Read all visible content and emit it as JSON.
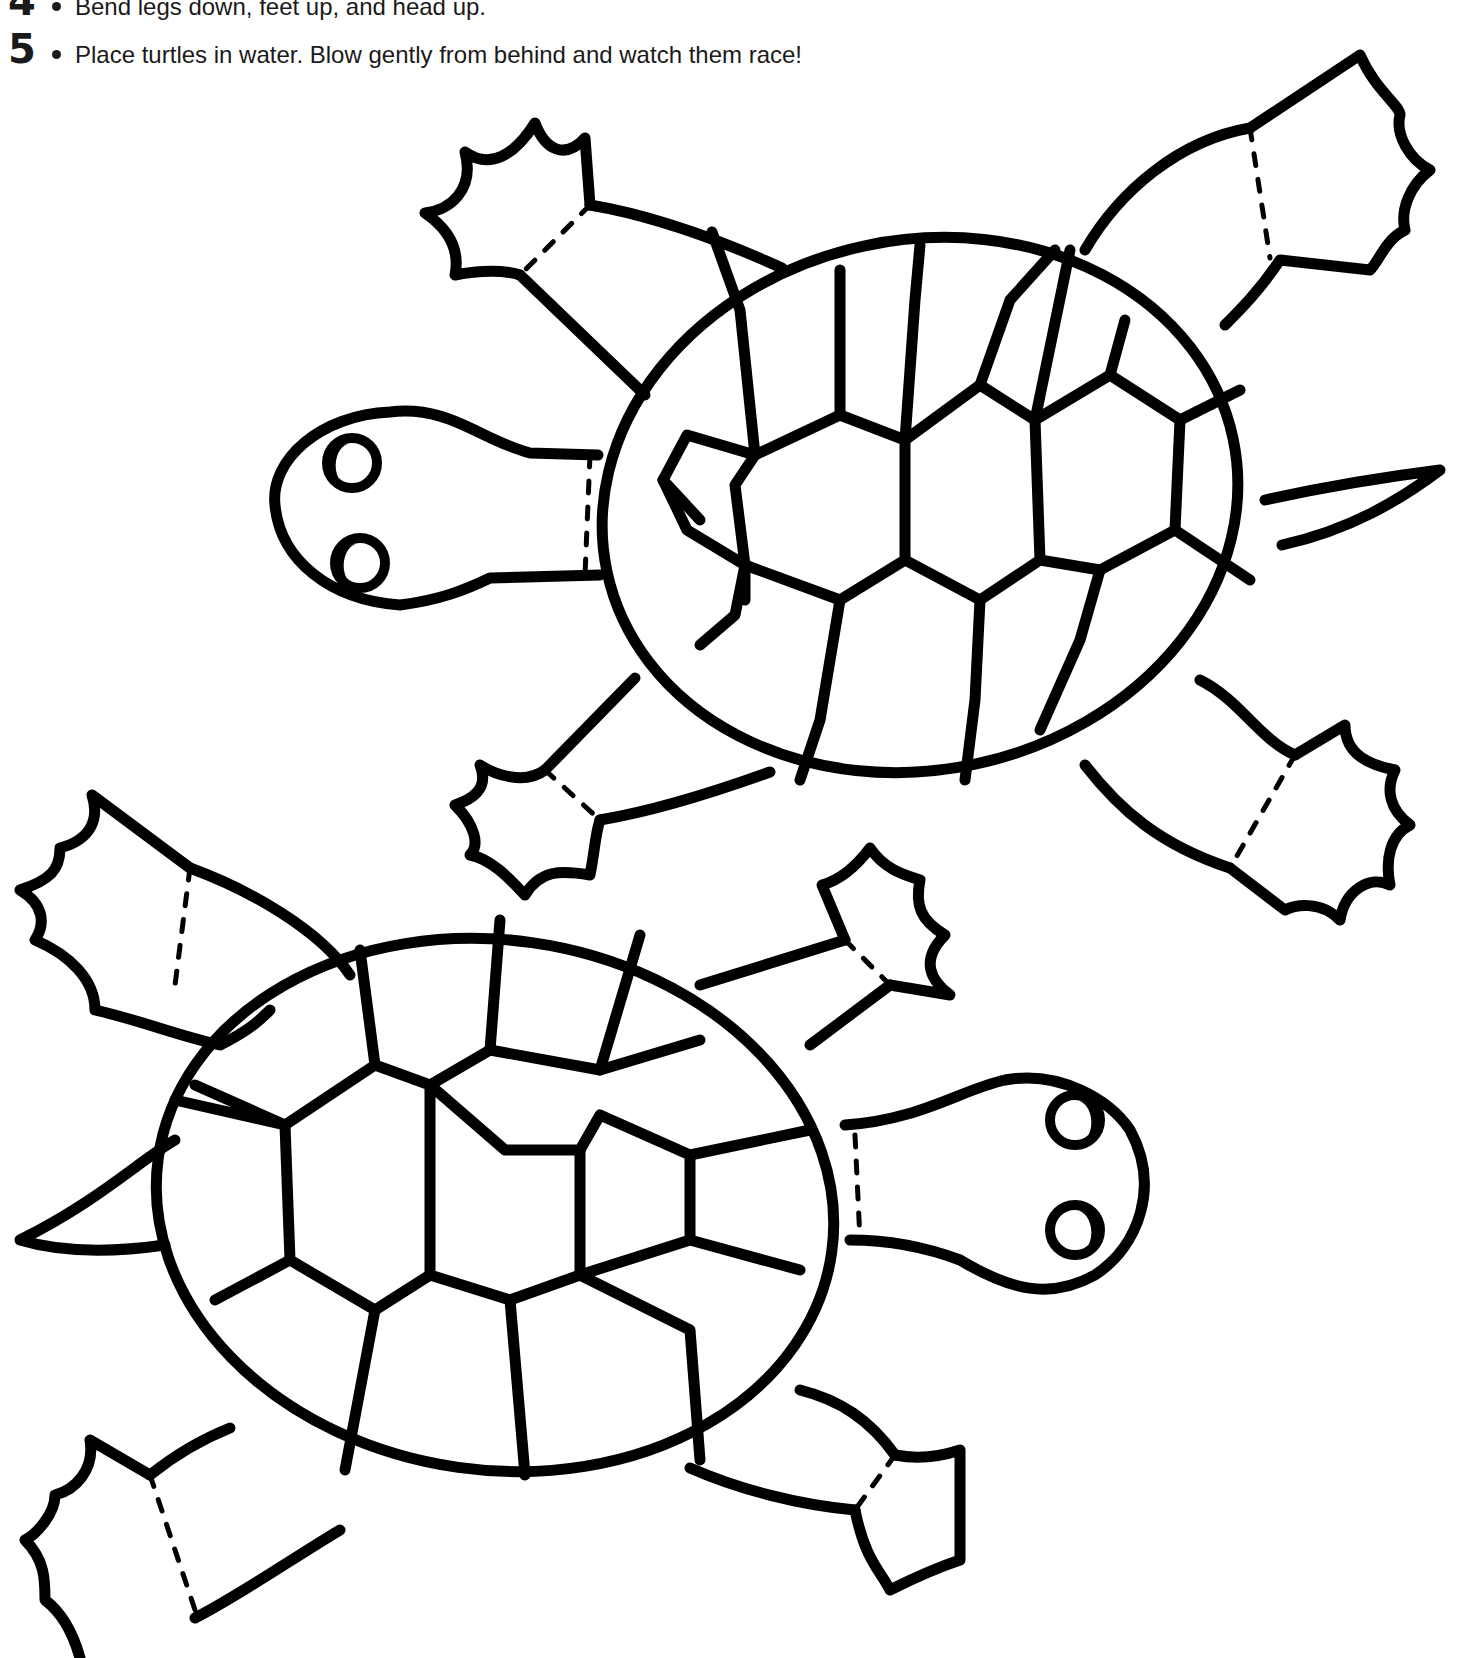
{
  "instructions": {
    "steps": [
      {
        "number": "4",
        "text": "Bend legs down, feet up, and head up."
      },
      {
        "number": "5",
        "text": "Place turtles in water. Blow gently from behind and watch them race!"
      }
    ]
  },
  "figures": [
    {
      "label": "turtle-cutout-top",
      "facing": "left"
    },
    {
      "label": "turtle-cutout-bottom",
      "facing": "right"
    }
  ],
  "colors": {
    "ink": "#000000",
    "background": "#ffffff"
  }
}
